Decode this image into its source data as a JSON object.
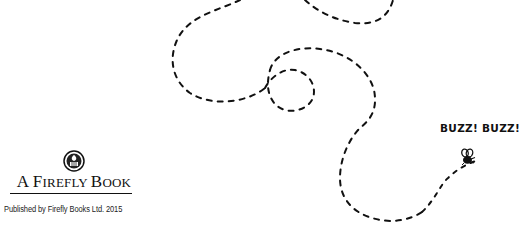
{
  "logo": {
    "emblem_icon": "crest-emblem-icon",
    "title_parts": [
      {
        "text": "A ",
        "small_caps": false
      },
      {
        "text": "F",
        "small_caps": false
      },
      {
        "text": "IREFLY ",
        "small_caps": true
      },
      {
        "text": "B",
        "small_caps": false
      },
      {
        "text": "OOK",
        "small_caps": true
      }
    ],
    "title": "A Firefly Book"
  },
  "publisher_line": "Published by Firefly Books Ltd. 2015",
  "illustration": {
    "caption": "BUZZ! BUZZ!",
    "bee_icon": "bee-icon",
    "trail_style": "dashed",
    "trail_color": "#111111"
  }
}
